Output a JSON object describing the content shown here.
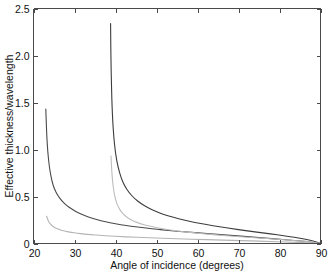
{
  "chart_data": {
    "type": "line",
    "title": "",
    "xlabel": "Angle of incidence (degrees)",
    "ylabel": "Effective thickness/wavelength",
    "xlim": [
      20,
      90
    ],
    "ylim": [
      0,
      2.5
    ],
    "xticks": [
      20,
      30,
      40,
      50,
      60,
      70,
      80,
      90
    ],
    "xtick_labels": [
      "20",
      "30",
      "40",
      "50",
      "60",
      "70",
      "80",
      "90"
    ],
    "yticks": [
      0,
      0.5,
      1.0,
      1.5,
      2.0,
      2.5
    ],
    "ytick_labels": [
      "0",
      "0.5",
      "1.0",
      "1.5",
      "2.0",
      "2.5"
    ],
    "grid": false,
    "legend": "none",
    "series": [
      {
        "name": "curve-1-dark-low-critical-angle",
        "color": "#4a4a4a",
        "width": 1.1,
        "critical_angle": 23.0,
        "start_value": 1.43,
        "x": [
          23.0,
          23.3,
          23.7,
          24.2,
          24.8,
          25.5,
          26.4,
          27.4,
          28.6,
          30.0,
          31.6,
          33.4,
          35.4,
          37.6,
          40.0,
          42.6,
          45.4,
          48.4,
          51.6,
          55.0,
          58.6,
          62.4,
          66.4,
          70.6,
          75.0,
          79.6,
          84.4,
          87.0,
          88.6,
          89.5,
          90.0
        ],
        "y": [
          1.43,
          1.1,
          0.88,
          0.73,
          0.62,
          0.545,
          0.482,
          0.432,
          0.388,
          0.349,
          0.314,
          0.283,
          0.256,
          0.232,
          0.211,
          0.192,
          0.175,
          0.159,
          0.145,
          0.131,
          0.118,
          0.105,
          0.092,
          0.078,
          0.063,
          0.047,
          0.029,
          0.019,
          0.011,
          0.004,
          0.0
        ]
      },
      {
        "name": "curve-2-light-low-critical-angle",
        "color": "#b4b4b4",
        "width": 1.1,
        "critical_angle": 23.2,
        "start_value": 0.29,
        "x": [
          23.2,
          23.6,
          24.1,
          24.7,
          25.4,
          26.3,
          27.3,
          28.5,
          29.9,
          31.5,
          33.3,
          35.3,
          37.5,
          39.9,
          42.5,
          45.3,
          48.3,
          51.5,
          54.9,
          58.5,
          62.3,
          66.3,
          70.5,
          74.9,
          79.5,
          84.3,
          87.0,
          88.6,
          89.5,
          90.0
        ],
        "y": [
          0.29,
          0.243,
          0.208,
          0.183,
          0.164,
          0.148,
          0.135,
          0.124,
          0.114,
          0.105,
          0.097,
          0.09,
          0.083,
          0.077,
          0.071,
          0.066,
          0.061,
          0.056,
          0.051,
          0.046,
          0.041,
          0.036,
          0.031,
          0.025,
          0.019,
          0.012,
          0.008,
          0.004,
          0.002,
          0.0
        ]
      },
      {
        "name": "curve-3-dark-high-critical-angle",
        "color": "#3c3c3c",
        "width": 1.1,
        "critical_angle": 38.8,
        "start_value": 2.34,
        "x": [
          38.8,
          38.9,
          39.1,
          39.4,
          39.8,
          40.3,
          41.0,
          41.8,
          42.8,
          44.0,
          45.4,
          47.0,
          48.8,
          50.8,
          53.0,
          55.4,
          58.0,
          60.8,
          63.8,
          67.0,
          70.4,
          74.0,
          77.8,
          81.8,
          85.0,
          87.2,
          88.6,
          89.5,
          90.0
        ],
        "y": [
          2.34,
          1.95,
          1.55,
          1.25,
          1.04,
          0.885,
          0.755,
          0.655,
          0.575,
          0.508,
          0.452,
          0.404,
          0.362,
          0.325,
          0.293,
          0.264,
          0.237,
          0.212,
          0.189,
          0.167,
          0.145,
          0.124,
          0.102,
          0.078,
          0.056,
          0.037,
          0.022,
          0.009,
          0.0
        ]
      },
      {
        "name": "curve-4-light-high-critical-angle",
        "color": "#bebebe",
        "width": 1.1,
        "critical_angle": 38.9,
        "start_value": 0.93,
        "x": [
          38.9,
          39.1,
          39.4,
          39.8,
          40.3,
          41.0,
          41.8,
          42.8,
          44.0,
          45.4,
          47.0,
          48.8,
          50.8,
          53.0,
          55.4,
          58.0,
          60.8,
          63.8,
          67.0,
          70.4,
          74.0,
          77.8,
          81.8,
          85.0,
          87.2,
          88.6,
          89.5,
          90.0
        ],
        "y": [
          0.93,
          0.77,
          0.62,
          0.51,
          0.43,
          0.366,
          0.318,
          0.279,
          0.248,
          0.222,
          0.199,
          0.18,
          0.162,
          0.146,
          0.132,
          0.118,
          0.106,
          0.094,
          0.083,
          0.072,
          0.061,
          0.05,
          0.038,
          0.027,
          0.018,
          0.011,
          0.004,
          0.0
        ]
      }
    ]
  }
}
